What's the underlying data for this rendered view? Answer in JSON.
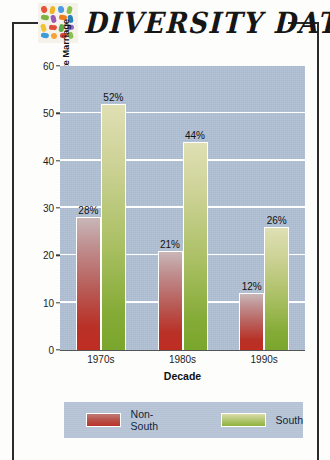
{
  "header": {
    "title": "DIVERSITY DATA",
    "logo_name": "diversity-mosaic-logo"
  },
  "chart_data": {
    "type": "bar",
    "title": "",
    "categories": [
      "1970s",
      "1980s",
      "1990s"
    ],
    "series": [
      {
        "name": "Non-South",
        "values": [
          28,
          21,
          12
        ],
        "labels": [
          "28%",
          "21%",
          "12%"
        ],
        "color": "#b9332a"
      },
      {
        "name": "South",
        "values": [
          52,
          44,
          26
        ],
        "labels": [
          "52%",
          "44%",
          "26%"
        ],
        "color": "#8fb23c"
      }
    ],
    "xlabel": "Decade",
    "ylabel": "Percent of Whites Favoring Laws against Black-White Marriage",
    "ylim": [
      0,
      60
    ],
    "yticks": [
      0,
      10,
      20,
      30,
      40,
      50,
      60
    ],
    "ytick_labels": [
      "0",
      "10",
      "20",
      "30",
      "40",
      "50",
      "60"
    ],
    "grid": true,
    "gridline_values": [
      10,
      20,
      30,
      40,
      50
    ],
    "legend_position": "bottom",
    "plot_background": "#aebed2",
    "gridline_color": "#ffffff"
  }
}
